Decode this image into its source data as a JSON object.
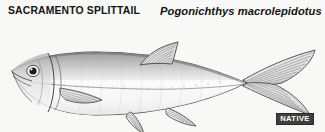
{
  "plate": {
    "background_color": "#f8f8f6",
    "common_name": "SACRAMENTO SPLITTAIL",
    "scientific_name": "Pogonichthys macrolepidotus"
  },
  "status_badge": {
    "label": "NATIVE",
    "background_color": "#3f3f3f",
    "text_color": "#ffffff"
  },
  "illustration": {
    "name": "sacramento-splittail-fish-illustration",
    "style": "pen-and-ink stipple line drawing",
    "ink_color": "#3a3a3a",
    "body_fill": "#ffffff",
    "upper_body_shade": "#c9c9c9",
    "parts": [
      "snout",
      "eye",
      "operculum",
      "pectoral-fin",
      "dorsal-fin",
      "pelvic-fin",
      "anal-fin",
      "caudal-fin-forked",
      "lateral-line"
    ]
  }
}
